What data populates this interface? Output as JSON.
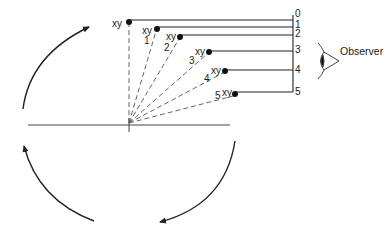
{
  "diagram": {
    "observer_label": "Observer",
    "point_label": "xy",
    "points": [
      {
        "id": "0",
        "x": 129,
        "y": 22,
        "label": "xy",
        "index": "",
        "scale": "0",
        "scale_y": 22
      },
      {
        "id": "1",
        "x": 157,
        "y": 29,
        "label": "xy",
        "index": "1",
        "scale": "1",
        "scale_y": 29
      },
      {
        "id": "2",
        "x": 180,
        "y": 37,
        "label": "xy",
        "index": "2",
        "scale": "2",
        "scale_y": 37
      },
      {
        "id": "3",
        "x": 209,
        "y": 52,
        "label": "xy",
        "index": "3",
        "scale": "3",
        "scale_y": 51
      },
      {
        "id": "4",
        "x": 225,
        "y": 71,
        "label": "xy",
        "index": "4",
        "scale": "4",
        "scale_y": 71
      },
      {
        "id": "5",
        "x": 235,
        "y": 94,
        "label": "xy",
        "index": "5",
        "scale": "5",
        "scale_y": 92
      }
    ],
    "scale_labels": [
      "0",
      "1",
      "2",
      "3",
      "4",
      "5"
    ],
    "origin": {
      "x": 129,
      "y": 123
    },
    "colors": {
      "line": "#222222",
      "dashed": "#555555",
      "axis": "#444444"
    }
  }
}
